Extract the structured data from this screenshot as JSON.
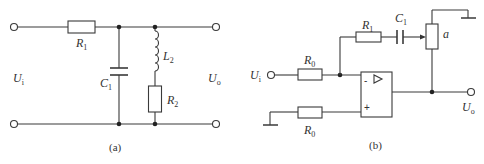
{
  "figure_a": {
    "caption": "(a)",
    "labels": {
      "R1": {
        "main": "R",
        "sub": "1"
      },
      "C1": {
        "main": "C",
        "sub": "1"
      },
      "L2": {
        "main": "L",
        "sub": "2"
      },
      "R2": {
        "main": "R",
        "sub": "2"
      },
      "Ui": {
        "main": "U",
        "sub": "i"
      },
      "Uo": {
        "main": "U",
        "sub": "o"
      }
    }
  },
  "figure_b": {
    "caption": "(b)",
    "labels": {
      "R1": {
        "main": "R",
        "sub": "1"
      },
      "C1": {
        "main": "C",
        "sub": "1"
      },
      "pot": "a",
      "R0_top": {
        "main": "R",
        "sub": "0"
      },
      "R0_bottom": {
        "main": "R",
        "sub": "0"
      },
      "Ui": {
        "main": "U",
        "sub": "i"
      },
      "Uo": {
        "main": "U",
        "sub": "o"
      },
      "minus": "-",
      "plus": "+"
    }
  },
  "colors": {
    "line": "#3a3a3a",
    "text": "#333333",
    "background": "#ffffff"
  }
}
